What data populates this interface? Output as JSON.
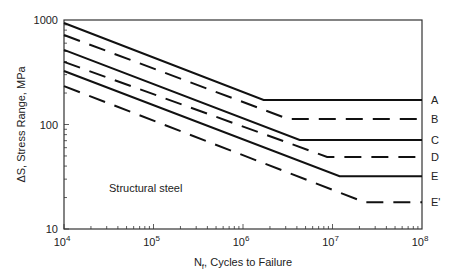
{
  "chart_data": {
    "type": "line",
    "title": "",
    "xlabel": "N_f, Cycles to Failure",
    "ylabel": "ΔS, Stress Range, MPa",
    "xscale": "log",
    "yscale": "log",
    "xlim": [
      10000,
      100000000
    ],
    "ylim": [
      10,
      1000
    ],
    "x_ticks": [
      "10^4",
      "10^5",
      "10^6",
      "10^7",
      "10^8"
    ],
    "y_ticks": [
      "10",
      "100",
      "1000"
    ],
    "grid": false,
    "legend_position": "inline-right",
    "annotations": [
      "Structural steel"
    ],
    "series": [
      {
        "name": "A",
        "style": "solid",
        "points": [
          [
            10000,
            936
          ],
          [
            1700000,
            172
          ],
          [
            100000000,
            172
          ]
        ]
      },
      {
        "name": "B",
        "style": "dashed",
        "points": [
          [
            10000,
            719
          ],
          [
            3200000,
            113
          ],
          [
            100000000,
            113
          ]
        ]
      },
      {
        "name": "C",
        "style": "solid",
        "points": [
          [
            10000,
            517
          ],
          [
            4300000,
            71
          ],
          [
            100000000,
            71
          ]
        ]
      },
      {
        "name": "D",
        "style": "dashed",
        "points": [
          [
            10000,
            397
          ],
          [
            8700000,
            49
          ],
          [
            100000000,
            49
          ]
        ]
      },
      {
        "name": "E",
        "style": "solid",
        "points": [
          [
            10000,
            325
          ],
          [
            12000000,
            32
          ],
          [
            100000000,
            32
          ]
        ]
      },
      {
        "name": "E'",
        "style": "dashed",
        "points": [
          [
            10000,
            233
          ],
          [
            23000000,
            18
          ],
          [
            100000000,
            18
          ]
        ]
      }
    ]
  },
  "labels": {
    "xlabel_main": "N",
    "xlabel_sub": "f",
    "xlabel_rest": ", Cycles to Failure",
    "ylabel": "ΔS, Stress Range, MPa",
    "annotation": "Structural steel",
    "x_tick_base": "10",
    "x_tick_exps": [
      "4",
      "5",
      "6",
      "7",
      "8"
    ],
    "y_ticks": [
      "1000",
      "100",
      "10"
    ],
    "curves": [
      "A",
      "B",
      "C",
      "D",
      "E",
      "E'"
    ]
  }
}
